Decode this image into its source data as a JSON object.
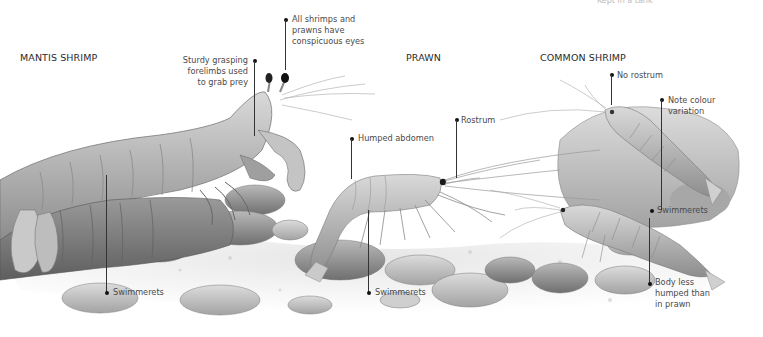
{
  "figure": {
    "top_clipped_text": "Kept in a tank",
    "colors": {
      "background": "#ffffff",
      "ink": "#2a2a2a",
      "label": "#4a4a4a",
      "leader": "#333333"
    }
  },
  "species": [
    {
      "id": "mantis-shrimp",
      "heading": "MANTIS SHRIMP",
      "annotations": [
        {
          "text": [
            "Sturdy grasping",
            "forelimbs used",
            "to grab prey"
          ]
        },
        {
          "text": [
            "All shrimps and",
            "prawns have",
            "conspicuous eyes"
          ]
        },
        {
          "text": [
            "Swimmerets"
          ]
        }
      ]
    },
    {
      "id": "prawn",
      "heading": "PRAWN",
      "annotations": [
        {
          "text": [
            "Humped abdomen"
          ]
        },
        {
          "text": [
            "Rostrum"
          ]
        },
        {
          "text": [
            "Swimmerets"
          ]
        }
      ]
    },
    {
      "id": "common-shrimp",
      "heading": "COMMON SHRIMP",
      "annotations": [
        {
          "text": [
            "No rostrum"
          ]
        },
        {
          "text": [
            "Note colour",
            "variation"
          ]
        },
        {
          "text": [
            "Swimmerets"
          ]
        },
        {
          "text": [
            "Body less",
            "humped than",
            "in prawn"
          ]
        }
      ]
    }
  ]
}
